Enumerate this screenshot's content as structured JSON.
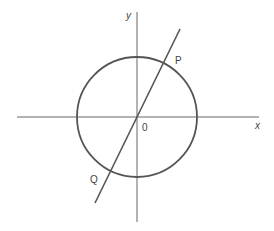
{
  "diagram": {
    "title": "",
    "width": 274,
    "height": 231,
    "background": "#ffffff",
    "stroke_color": "#555555",
    "axis_color": "#666666",
    "x_axis": {
      "label": "x",
      "x1": 17,
      "y1": 117,
      "x2": 259,
      "y2": 117,
      "label_pos": [
        255,
        129
      ]
    },
    "y_axis": {
      "label": "y",
      "x1": 137,
      "y1": 12,
      "x2": 137,
      "y2": 222,
      "label_pos": [
        126,
        19
      ]
    },
    "origin": {
      "label": "0",
      "pos": [
        137,
        117
      ],
      "label_pos": [
        142,
        131
      ]
    },
    "circle": {
      "cx": 137,
      "cy": 117,
      "r": 60
    },
    "line": {
      "x1": 95,
      "y1": 203,
      "x2": 180,
      "y2": 29
    },
    "points": [
      {
        "label": "P",
        "pos": [
          165,
          61
        ],
        "label_pos": [
          175,
          64
        ]
      },
      {
        "label": "Q",
        "pos": [
          110,
          172
        ],
        "label_pos": [
          90,
          183
        ]
      }
    ]
  }
}
